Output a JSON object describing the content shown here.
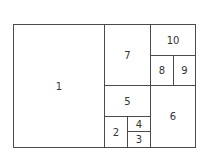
{
  "diagram": {
    "type": "rectangle-subdivision",
    "line_color": "#4a4a4a",
    "text_color": "#333333",
    "background": "#ffffff",
    "cells": [
      {
        "label": "1",
        "x": 13,
        "y": 24,
        "w": 92,
        "h": 124
      },
      {
        "label": "7",
        "x": 104,
        "y": 24,
        "w": 47,
        "h": 62
      },
      {
        "label": "10",
        "x": 150,
        "y": 24,
        "w": 46,
        "h": 32
      },
      {
        "label": "8",
        "x": 150,
        "y": 55,
        "w": 24,
        "h": 31
      },
      {
        "label": "9",
        "x": 173,
        "y": 55,
        "w": 23,
        "h": 31
      },
      {
        "label": "5",
        "x": 104,
        "y": 85,
        "w": 47,
        "h": 32
      },
      {
        "label": "6",
        "x": 150,
        "y": 85,
        "w": 46,
        "h": 63
      },
      {
        "label": "2",
        "x": 104,
        "y": 116,
        "w": 24,
        "h": 32
      },
      {
        "label": "4",
        "x": 127,
        "y": 116,
        "w": 24,
        "h": 16
      },
      {
        "label": "3",
        "x": 127,
        "y": 131,
        "w": 24,
        "h": 17
      }
    ]
  }
}
